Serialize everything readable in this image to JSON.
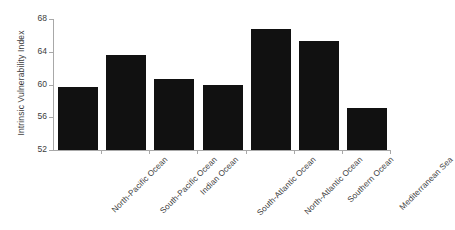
{
  "chart_data": {
    "type": "bar",
    "title": "",
    "xlabel": "",
    "ylabel": "Intrinsic Vulnerability Index",
    "categories": [
      "North-Pacific Ocean",
      "South-Pacific Ocean",
      "Indian Ocean",
      "South-Atlantic Ocean",
      "North-Atlantic Ocean",
      "Southern Ocean",
      "Mediterranean Sea"
    ],
    "values": [
      59.7,
      63.6,
      60.7,
      59.9,
      66.8,
      65.3,
      57.1
    ],
    "ylim": [
      52,
      68
    ],
    "yticks": [
      52,
      56,
      60,
      64,
      68
    ],
    "ytick_labels": [
      "52",
      "56",
      "60",
      "64",
      "68"
    ],
    "grid": false,
    "legend": false,
    "bar_color": "#111111",
    "axis_color": "#a8a8a8",
    "text_color": "#3c3c3c",
    "background": "#ffffff"
  }
}
